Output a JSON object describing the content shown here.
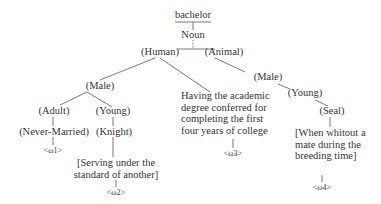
{
  "diagram": {
    "root": "bachelor",
    "pos": "Noun",
    "nodes": {
      "human": "(Human)",
      "animal": "(Animal)",
      "male_h": "(Male)",
      "adult": "(Adult)",
      "young_h": "(Young)",
      "never_married": "(Never-Married)",
      "knight": "(Knight)",
      "male_a": "(Male)",
      "young_a": "(Young)",
      "seal": "(Seal)"
    },
    "distinguishers": {
      "d2": [
        "[Serving under the",
        "standard of another]"
      ],
      "d3": [
        "Having the academic",
        "degree conferred for",
        "completing the first",
        "four years of college"
      ],
      "d4": [
        "[When whitout a",
        "mate during the",
        "breeding time]"
      ]
    },
    "senses": {
      "s1": "<ω1>",
      "s2": "<ω2>",
      "s3": "<ω3>",
      "s4": "<ω4>"
    }
  }
}
